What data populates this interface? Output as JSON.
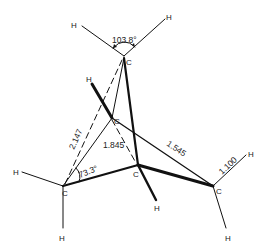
{
  "diagram": {
    "type": "molecular-structure",
    "atoms": {
      "c_top": {
        "symbol": "C",
        "x": 124,
        "y": 56
      },
      "c_mid": {
        "symbol": "C",
        "x": 112,
        "y": 118
      },
      "c_left": {
        "symbol": "C",
        "x": 63,
        "y": 186
      },
      "c_center": {
        "symbol": "C",
        "x": 138,
        "y": 165
      },
      "c_right": {
        "symbol": "C",
        "x": 213,
        "y": 186
      },
      "h_top_left": {
        "symbol": "H",
        "x": 17,
        "y": 28
      },
      "h_top_right": {
        "symbol": "H",
        "x": 110,
        "y": 17
      },
      "h_mid": {
        "symbol": "H",
        "x": 89,
        "y": 80
      },
      "h_left": {
        "symbol": "H",
        "x": 17,
        "y": 172
      },
      "h_left_down": {
        "symbol": "H",
        "x": 63,
        "y": 237
      },
      "h_center": {
        "symbol": "H",
        "x": 157,
        "y": 208
      },
      "h_right_up": {
        "symbol": "H",
        "x": 250,
        "y": 154
      },
      "h_right_down": {
        "symbol": "H",
        "x": 228,
        "y": 237
      }
    },
    "annotations": {
      "angle_top": "103.8°",
      "angle_left": "73.3°",
      "dist_dashed_long": "2.147",
      "dist_dashed_mid": "1.845",
      "bond_cc": "1.545",
      "bond_ch": "1.100"
    }
  }
}
